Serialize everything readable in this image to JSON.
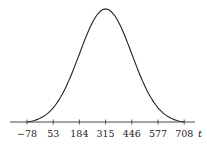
{
  "chart_data": {
    "type": "line",
    "title": "",
    "xlabel": "t",
    "ylabel": "",
    "mean": 315,
    "sd": 131,
    "x_ticks": [
      -78,
      53,
      184,
      315,
      446,
      577,
      708
    ],
    "x_tick_labels": [
      "−78",
      "53",
      "184",
      "315",
      "446",
      "577",
      "708"
    ],
    "xlim": [
      -78,
      708
    ],
    "grid": false,
    "legend": null,
    "series": [
      {
        "name": "normal density",
        "color": "#222222"
      }
    ]
  },
  "layout": {
    "axis_y": 122,
    "x_px_start": 27,
    "x_px_step": 26.2,
    "axis_line_x": [
      10,
      195
    ],
    "peak_y": 9,
    "label_y": 137,
    "xlabel_x": 200
  }
}
